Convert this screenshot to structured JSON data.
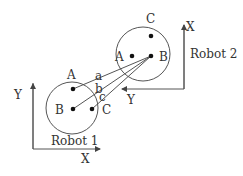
{
  "diagram": {
    "robot1": {
      "label": "Robot 1",
      "axis_x": "X",
      "axis_y": "Y",
      "points": {
        "A": "A",
        "B": "B",
        "C": "C"
      }
    },
    "robot2": {
      "label": "Robot 2",
      "axis_x": "X",
      "axis_y": "Y",
      "points": {
        "A": "A",
        "B": "B",
        "C": "C"
      }
    },
    "lines": {
      "a": "a",
      "b": "b",
      "c": "c"
    },
    "colors": {
      "stroke": "#555555",
      "text": "#333333"
    }
  }
}
